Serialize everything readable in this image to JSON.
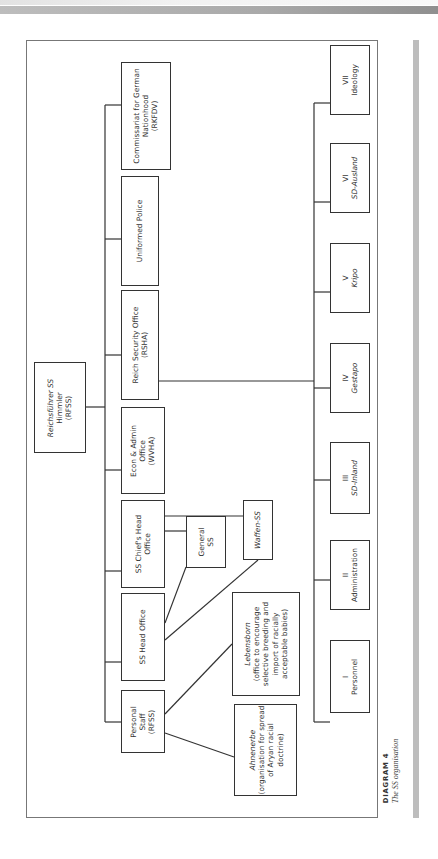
{
  "page": {
    "header_band_color": "#a9a9a9",
    "side_bar_color": "#bdbdbd",
    "line_color": "#333333"
  },
  "diagram": {
    "root": {
      "lines": [
        "Reichsführer SS",
        "Himmler",
        "(RFSS)"
      ],
      "italic_first": true
    },
    "top_level": [
      {
        "id": "rkfdv",
        "lines": [
          "Commissariat for German",
          "Nationhood",
          "(RKFDV)"
        ]
      },
      {
        "id": "police",
        "lines": [
          "Uniformed Police"
        ]
      },
      {
        "id": "rsha",
        "lines": [
          "Reich Security Office",
          "(RSHA)"
        ]
      },
      {
        "id": "wvha",
        "lines": [
          "Econ & Admin",
          "Office",
          "(WVHA)"
        ]
      },
      {
        "id": "chief",
        "lines": [
          "SS Chief's Head",
          "Office"
        ]
      },
      {
        "id": "head",
        "lines": [
          "SS Head Office"
        ]
      },
      {
        "id": "staff",
        "lines": [
          "Personal",
          "Staff",
          "(RFSS)"
        ]
      }
    ],
    "sub_units": [
      {
        "id": "general-ss",
        "lines": [
          "General",
          "SS"
        ]
      },
      {
        "id": "waffen-ss",
        "lines": [
          "Waffen-SS"
        ],
        "italic": true
      },
      {
        "id": "lebensborn",
        "lines": [
          "Lebensborn",
          "(office to encourage",
          "selective breeding and",
          "import of racially",
          "acceptable babies)"
        ],
        "italic_first": true
      },
      {
        "id": "ahnenerbe",
        "lines": [
          "Ahnenerbe",
          "(organisation for spread",
          "of Aryan racial",
          "doctrine)"
        ],
        "italic_first": true
      }
    ],
    "rsha_departments": [
      {
        "numeral": "VII",
        "name": "Ideology",
        "italic": false
      },
      {
        "numeral": "VI",
        "name": "SD-Ausland",
        "italic": true
      },
      {
        "numeral": "V",
        "name": "Kripo",
        "italic": true
      },
      {
        "numeral": "IV",
        "name": "Gestapo",
        "italic": true
      },
      {
        "numeral": "III",
        "name": "SD-Inland",
        "italic": true
      },
      {
        "numeral": "II",
        "name": "Administration",
        "italic": false
      },
      {
        "numeral": "I",
        "name": "Personnel",
        "italic": false
      }
    ]
  },
  "caption": {
    "title": "DIAGRAM 4",
    "subtitle": "The SS organisation"
  }
}
